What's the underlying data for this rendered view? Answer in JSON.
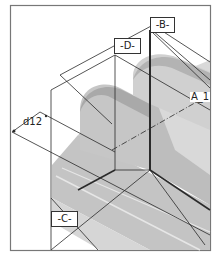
{
  "viewport": {
    "labels": {
      "datum_b": "-B-",
      "datum_d": "-D-",
      "datum_c": "-C-",
      "axis": "A_1",
      "dimension": "d12"
    },
    "colors": {
      "frame": "#666666",
      "line": "#2a2a2a",
      "shade_dark": "#b9b9b9",
      "shade_mid": "#cbcbcb",
      "shade_light": "#e2e2e2",
      "background": "#ffffff"
    }
  }
}
